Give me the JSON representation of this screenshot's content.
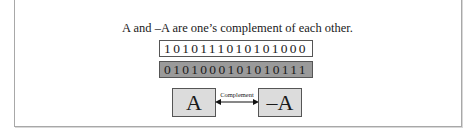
{
  "figure": {
    "caption": "A and –A are one’s complement of each other.",
    "bits_a": "1010111010101000",
    "bits_neg_a": "0101000101010111",
    "box_a_label": "A",
    "box_neg_a_label": "–A",
    "arrow_label": "Complement",
    "colors": {
      "bits_a_bg": "#ffffff",
      "bits_neg_a_bg": "#9a9a9a",
      "symbol_box_bg": "#dcdcdc",
      "border": "#555555"
    }
  }
}
